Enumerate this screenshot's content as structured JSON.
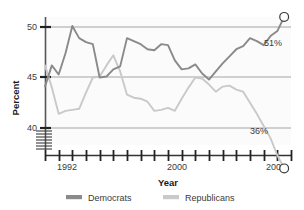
{
  "chart_data": {
    "type": "line",
    "title": "",
    "xlabel": "Year",
    "ylabel": "Percent",
    "xlim": [
      1991,
      2009
    ],
    "ylim": [
      39.0,
      50.8
    ],
    "y_ticks": [
      40,
      45,
      50
    ],
    "y_tick_labels": [
      "40",
      "45",
      "50"
    ],
    "x_ticks": [
      1991,
      1992,
      1993,
      1994,
      1995,
      1996,
      1997,
      1998,
      1999,
      2000,
      2001,
      2002,
      2003,
      2004,
      2005,
      2006,
      2007,
      2008,
      2009
    ],
    "x_tick_labels_shown": [
      "1992",
      "2000",
      "2008"
    ],
    "grid": "horizontal",
    "axis_break": true,
    "legend_position": "bottom",
    "x": [
      1991,
      1991.5,
      1992,
      1992.5,
      1993,
      1993.5,
      1994,
      1994.5,
      1995,
      1995.5,
      1996,
      1996.5,
      1997,
      1997.5,
      1998,
      1998.5,
      1999,
      1999.5,
      2000,
      2000.5,
      2001,
      2001.5,
      2002,
      2002.5,
      2003,
      2003.5,
      2004,
      2004.5,
      2005,
      2005.5,
      2006,
      2006.5,
      2007,
      2007.5,
      2008,
      2008.5
    ],
    "series": [
      {
        "name": "Democrats",
        "color": "#8a8a8a",
        "end_label": "51%",
        "end_marker": "open-circle",
        "values": [
          44.1,
          46.2,
          45.3,
          47.4,
          50.1,
          48.9,
          48.5,
          48.3,
          45.0,
          45.1,
          45.8,
          46.1,
          48.9,
          48.6,
          48.3,
          47.8,
          47.7,
          48.3,
          48.2,
          46.7,
          45.8,
          45.9,
          46.3,
          45.4,
          44.8,
          45.6,
          46.4,
          47.1,
          47.8,
          48.1,
          48.9,
          48.6,
          48.2,
          49.1,
          49.6,
          51.0
        ]
      },
      {
        "name": "Republicans",
        "color": "#c9c9c9",
        "end_label": "36%",
        "end_marker": "open-circle",
        "values": [
          46.2,
          44.0,
          41.4,
          41.7,
          41.8,
          41.9,
          43.5,
          45.0,
          45.1,
          46.2,
          47.2,
          45.6,
          43.3,
          43.0,
          42.9,
          42.6,
          41.7,
          41.8,
          42.0,
          41.7,
          42.9,
          44.0,
          45.0,
          44.9,
          44.3,
          43.6,
          44.1,
          44.2,
          43.8,
          43.6,
          42.5,
          41.4,
          40.2,
          39.0,
          37.3,
          36.0
        ]
      }
    ]
  },
  "axes": {
    "y_label": "Percent",
    "x_label": "Year",
    "y_ticks": [
      "50",
      "45",
      "40"
    ],
    "x_ticks": [
      "1992",
      "2000",
      "2008"
    ]
  },
  "annotations": {
    "democrat_end": "51%",
    "republican_end": "36%"
  },
  "legend": {
    "items": [
      {
        "label": "Democrats",
        "color": "#8a8a8a"
      },
      {
        "label": "Republicans",
        "color": "#c9c9c9"
      }
    ]
  },
  "colors": {
    "democrats": "#8a8a8a",
    "republicans": "#c9c9c9",
    "axis": "#555555",
    "grid": "#9a9a9a",
    "text": "#3a3a3a",
    "plot_bg": "#fbfbfb"
  }
}
